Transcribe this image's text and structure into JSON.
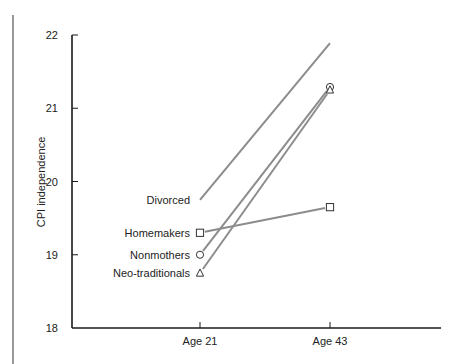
{
  "chart_data": {
    "type": "line",
    "title": "",
    "xlabel": "",
    "ylabel": "CPI independence",
    "categories": [
      "Age 21",
      "Age 43"
    ],
    "ylim": [
      18,
      22
    ],
    "yticks": [
      18,
      19,
      20,
      21,
      22
    ],
    "grid": false,
    "legend_position": "inline-left-labels",
    "series": [
      {
        "name": "Divorced",
        "marker": "none",
        "values": [
          19.75,
          21.89
        ]
      },
      {
        "name": "Homemakers",
        "marker": "square",
        "values": [
          19.3,
          19.65
        ]
      },
      {
        "name": "Nonmothers",
        "marker": "circle",
        "values": [
          19.0,
          21.29
        ]
      },
      {
        "name": "Neo-traditionals",
        "marker": "triangle",
        "values": [
          18.75,
          21.25
        ]
      }
    ]
  },
  "colors": {
    "line": "#8c8c8c",
    "axis": "#1a1a1a",
    "text": "#222222",
    "frame": "#555555"
  }
}
